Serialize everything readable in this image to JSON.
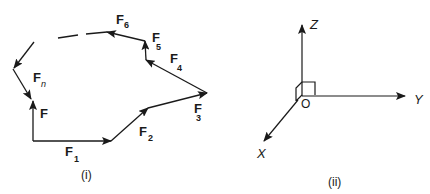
{
  "figure_i": {
    "caption": "(i)",
    "vectors": [
      {
        "name": "F",
        "main": "F",
        "sub": ""
      },
      {
        "name": "F1",
        "main": "F",
        "sub": "1"
      },
      {
        "name": "F2",
        "main": "F",
        "sub": "2"
      },
      {
        "name": "F3",
        "main": "F",
        "sub": "3"
      },
      {
        "name": "F4",
        "main": "F",
        "sub": "4"
      },
      {
        "name": "F5",
        "main": "F",
        "sub": "5"
      },
      {
        "name": "F6",
        "main": "F",
        "sub": "6"
      },
      {
        "name": "Fn",
        "main": "F",
        "sub": "n"
      }
    ]
  },
  "figure_ii": {
    "caption": "(ii)",
    "axes": {
      "x": "X",
      "y": "Y",
      "z": "Z",
      "origin": "O"
    }
  },
  "colors": {
    "stroke": "#1a1a1a",
    "background": "#ffffff"
  }
}
